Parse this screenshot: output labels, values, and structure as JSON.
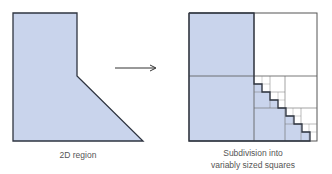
{
  "left_panel": {
    "label": "2D region",
    "fill_color": "#c9d4ec",
    "stroke_color": "#2e3440"
  },
  "arrow": {
    "direction": "right",
    "color": "#333333"
  },
  "right_panel": {
    "label_line1": "Subdivision into",
    "label_line2": "variably sized squares",
    "fill_color": "#c9d4ec",
    "grid_color": "#555555"
  }
}
